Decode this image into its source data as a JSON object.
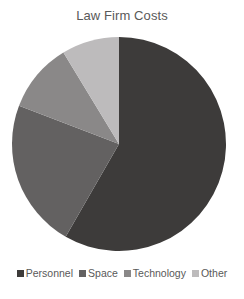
{
  "chart_data": {
    "type": "pie",
    "title": "Law Firm Costs",
    "categories": [
      "Personnel",
      "Space",
      "Technology",
      "Other"
    ],
    "values": [
      58.3,
      22.5,
      10.5,
      8.7
    ],
    "unit": "percent (estimated from slice angles)",
    "colors": [
      "#3d3b3a",
      "#636161",
      "#8a8888",
      "#bdbbbc"
    ],
    "start_angle": "12 o'clock, clockwise",
    "legend_position": "bottom"
  },
  "legend": {
    "items": [
      {
        "label": "Personnel",
        "color": "#3d3b3a"
      },
      {
        "label": "Space",
        "color": "#636161"
      },
      {
        "label": "Technology",
        "color": "#8a8888"
      },
      {
        "label": "Other",
        "color": "#bdbbbc"
      }
    ]
  }
}
